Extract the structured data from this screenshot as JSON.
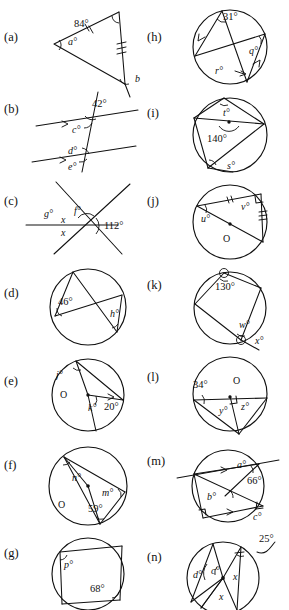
{
  "page": {
    "type": "geometry-worksheet",
    "columns": 2,
    "parts_total": 14
  },
  "parts": [
    {
      "id": "a",
      "tag": "(a)",
      "column": "left",
      "shape": "triangle",
      "labels": [
        {
          "text": "84°",
          "kind": "given"
        },
        {
          "text": "a°",
          "kind": "unknown"
        },
        {
          "text": "b",
          "kind": "unknown"
        }
      ],
      "marks": [
        "double-tick-side",
        "triple-tick-side",
        "right-angle-at-apex"
      ]
    },
    {
      "id": "b",
      "tag": "(b)",
      "column": "left",
      "shape": "parallel-lines-transversal",
      "labels": [
        {
          "text": "42°",
          "kind": "given"
        },
        {
          "text": "c°",
          "kind": "unknown"
        },
        {
          "text": "d°",
          "kind": "unknown"
        },
        {
          "text": "e°",
          "kind": "unknown"
        }
      ],
      "marks": [
        "single-arrow-parallel",
        "single-arrow-parallel"
      ]
    },
    {
      "id": "c",
      "tag": "(c)",
      "column": "left",
      "shape": "three-intersecting-lines",
      "labels": [
        {
          "text": "112°",
          "kind": "given"
        },
        {
          "text": "g°",
          "kind": "unknown"
        },
        {
          "text": "f°",
          "kind": "unknown"
        },
        {
          "text": "x",
          "kind": "unknown"
        },
        {
          "text": "x",
          "kind": "unknown"
        }
      ],
      "marks": []
    },
    {
      "id": "d",
      "tag": "(d)",
      "column": "left",
      "shape": "circle-inscribed-angles",
      "labels": [
        {
          "text": "46°",
          "kind": "given"
        },
        {
          "text": "h°",
          "kind": "unknown"
        }
      ],
      "marks": [
        "angle-arc",
        "angle-arc"
      ]
    },
    {
      "id": "e",
      "tag": "(e)",
      "column": "left",
      "shape": "circle-with-centre",
      "centre_label": "O",
      "labels": [
        {
          "text": "j°",
          "kind": "unknown"
        },
        {
          "text": "k°",
          "kind": "unknown"
        },
        {
          "text": "20°",
          "kind": "given"
        }
      ],
      "marks": [
        "angle-arc",
        "angle-arc"
      ]
    },
    {
      "id": "f",
      "tag": "(f)",
      "column": "left",
      "shape": "circle-with-centre",
      "centre_label": "O",
      "labels": [
        {
          "text": "n°",
          "kind": "unknown"
        },
        {
          "text": "m°",
          "kind": "unknown"
        },
        {
          "text": "59°",
          "kind": "given"
        }
      ],
      "marks": [
        "angle-arc",
        "angle-arc",
        "angle-arc"
      ]
    },
    {
      "id": "g",
      "tag": "(g)",
      "column": "left",
      "shape": "cyclic-quadrilateral",
      "labels": [
        {
          "text": "p°",
          "kind": "unknown"
        },
        {
          "text": "68°",
          "kind": "given"
        }
      ],
      "marks": [
        "angle-arc",
        "angle-arc"
      ]
    },
    {
      "id": "h",
      "tag": "(h)",
      "column": "right",
      "shape": "circle-parallel-chords",
      "labels": [
        {
          "text": "31°",
          "kind": "given"
        },
        {
          "text": "q°",
          "kind": "unknown"
        },
        {
          "text": "r°",
          "kind": "unknown"
        }
      ],
      "marks": [
        "single-arrow-parallel",
        "single-arrow-parallel"
      ]
    },
    {
      "id": "i",
      "tag": "(i)",
      "column": "right",
      "shape": "circle-with-centre",
      "labels": [
        {
          "text": "t°",
          "kind": "unknown"
        },
        {
          "text": "140°",
          "kind": "given"
        },
        {
          "text": "s°",
          "kind": "unknown"
        }
      ],
      "marks": [
        "angle-arc",
        "centre-dot",
        "angle-arc"
      ]
    },
    {
      "id": "j",
      "tag": "(j)",
      "column": "right",
      "shape": "circle-with-centre",
      "centre_label": "O",
      "labels": [
        {
          "text": "u°",
          "kind": "unknown"
        },
        {
          "text": "v°",
          "kind": "unknown"
        }
      ],
      "marks": [
        "double-tick-side",
        "triple-tick-side",
        "right-angle",
        "centre-dot"
      ]
    },
    {
      "id": "k",
      "tag": "(k)",
      "column": "right",
      "shape": "circle-cyclic-quad-extended",
      "labels": [
        {
          "text": "130°",
          "kind": "given"
        },
        {
          "text": "w°",
          "kind": "unknown"
        },
        {
          "text": "x°",
          "kind": "unknown"
        }
      ],
      "marks": [
        "angle-arc",
        "angle-arc"
      ]
    },
    {
      "id": "l",
      "tag": "(l)",
      "column": "right",
      "shape": "circle-with-centre-diameter",
      "centre_label": "O",
      "labels": [
        {
          "text": "34°",
          "kind": "given"
        },
        {
          "text": "y°",
          "kind": "unknown"
        },
        {
          "text": "z°",
          "kind": "unknown"
        }
      ],
      "marks": [
        "angle-arc",
        "right-angle",
        "centre-dot"
      ]
    },
    {
      "id": "m",
      "tag": "(m)",
      "column": "right",
      "shape": "circle-parallel-chords-secant",
      "labels": [
        {
          "text": "a°",
          "kind": "unknown"
        },
        {
          "text": "66°",
          "kind": "given"
        },
        {
          "text": "b°",
          "kind": "unknown"
        },
        {
          "text": "c°",
          "kind": "unknown"
        }
      ],
      "marks": [
        "single-arrow-parallel",
        "single-arrow-parallel",
        "right-angle",
        "angle-arc"
      ]
    },
    {
      "id": "n",
      "tag": "(n)",
      "column": "right",
      "shape": "circle-with-centre-multi-chord",
      "labels": [
        {
          "text": "25°",
          "kind": "given"
        },
        {
          "text": "d°",
          "kind": "unknown"
        },
        {
          "text": "c°",
          "kind": "unknown"
        },
        {
          "text": "x",
          "kind": "unknown"
        },
        {
          "text": "x",
          "kind": "unknown"
        }
      ],
      "marks": [
        "angle-arc",
        "centre-dot",
        "leader-line"
      ]
    }
  ]
}
